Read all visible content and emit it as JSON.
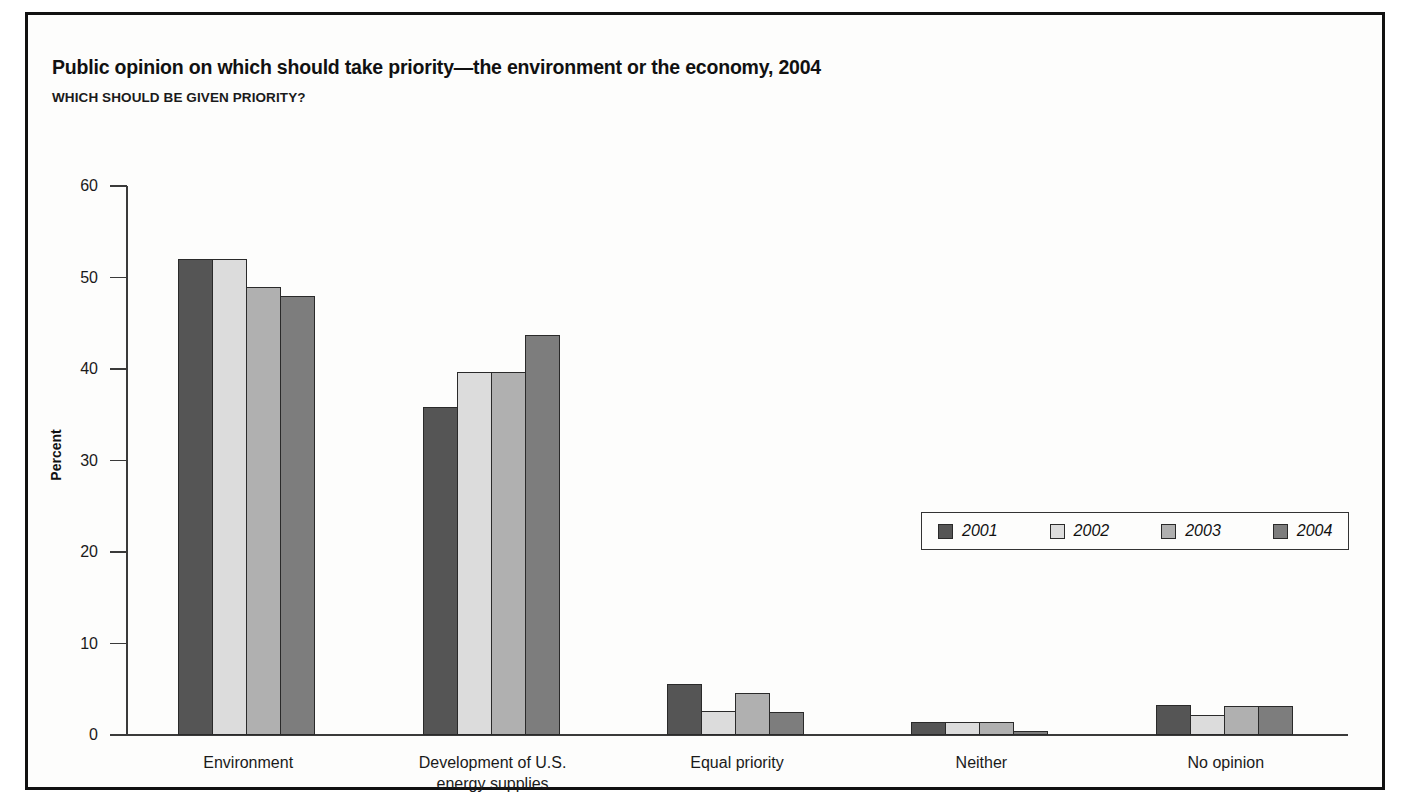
{
  "chart_data": {
    "type": "bar",
    "title": "Public opinion on which should take priority—the environment or the economy, 2004",
    "subtitle": "WHICH SHOULD BE GIVEN PRIORITY?",
    "xlabel": "",
    "ylabel": "Percent",
    "ylim": [
      0,
      60
    ],
    "yticks": [
      0,
      10,
      20,
      30,
      40,
      50,
      60
    ],
    "grid": false,
    "legend_position": "inside-right",
    "categories": [
      "Environment",
      "Development of U.S.\nenergy supplies",
      "Equal priority",
      "Neither",
      "No opinion"
    ],
    "series": [
      {
        "name": "2001",
        "color": "#555555",
        "values": [
          52.0,
          35.8,
          5.6,
          1.4,
          3.3
        ]
      },
      {
        "name": "2002",
        "color": "#dcdcdc",
        "values": [
          52.0,
          39.7,
          2.6,
          1.4,
          2.2
        ]
      },
      {
        "name": "2003",
        "color": "#b0b0b0",
        "values": [
          49.0,
          39.7,
          4.6,
          1.4,
          3.2
        ]
      },
      {
        "name": "2004",
        "color": "#7d7d7d",
        "values": [
          48.0,
          43.7,
          2.5,
          0.4,
          3.2
        ]
      }
    ]
  }
}
